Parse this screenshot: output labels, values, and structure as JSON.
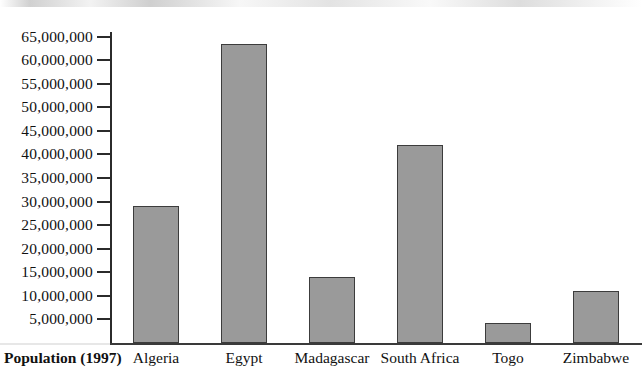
{
  "chart_data": {
    "type": "bar",
    "title": "",
    "subtitle": "",
    "xlabel": "Population (1997)",
    "ylabel": "",
    "categories": [
      "Algeria",
      "Egypt",
      "Madagascar",
      "South Africa",
      "Togo",
      "Zimbabwe"
    ],
    "values": [
      29000000,
      63500000,
      14000000,
      42000000,
      4300000,
      11000000
    ],
    "series": [
      {
        "name": "Population (1997)",
        "values": [
          29000000,
          63500000,
          14000000,
          42000000,
          4300000,
          11000000
        ]
      }
    ],
    "ylim": [
      0,
      67000000
    ],
    "ytick_values": [
      5000000,
      10000000,
      15000000,
      20000000,
      25000000,
      30000000,
      35000000,
      40000000,
      45000000,
      50000000,
      55000000,
      60000000,
      65000000
    ],
    "ytick_labels": [
      "5,000,000",
      "10,000,000",
      "15,000,000",
      "20,000,000",
      "25,000,000",
      "30,000,000",
      "35,000,000",
      "40,000,000",
      "45,000,000",
      "50,000,000",
      "55,000,000",
      "60,000,000",
      "65,000,000"
    ],
    "grid": false,
    "legend": false,
    "legend_position": "none",
    "bar_fill_color": "#9a9a9a",
    "bar_border_color": "#3c3c3c",
    "axis_color": "#2b2b2b",
    "background_color": "#ffffff",
    "annotations": []
  }
}
